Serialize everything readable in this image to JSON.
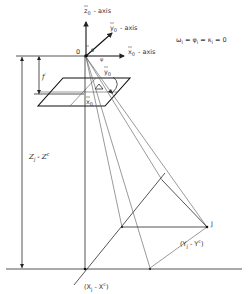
{
  "diagram": {
    "axes": {
      "z_axis_label": "z",
      "z_axis_sub": "0",
      "z_axis_suffix": "- axis",
      "y_axis_label": "y",
      "y_axis_sub": "0",
      "y_axis_suffix": "- axis",
      "x_axis_label": "x",
      "x_axis_sub": "0",
      "x_axis_suffix": "- axis"
    },
    "origin_label": "0",
    "equation": "ω",
    "equation_parts": [
      {
        "sym": "ω",
        "sub": "i"
      },
      {
        "sym": "φ",
        "sub": "i"
      },
      {
        "sym": "κ",
        "sub": "i"
      }
    ],
    "equation_value": "0",
    "focal_label": "f",
    "image_y_label": "y",
    "image_y_sub": "0",
    "image_x_label": "x",
    "image_x_sub": "0",
    "height_label": "Z",
    "height_label_sub": "j",
    "height_label_rest": "- Z",
    "height_label_sup": "c",
    "point_label": "J",
    "y_diff_label": "(Y",
    "y_diff_sub": "j",
    "y_diff_rest": "- Y",
    "y_diff_sup": "c",
    "y_diff_close": ")",
    "x_diff_label": "(X",
    "x_diff_sub": "j",
    "x_diff_rest": "- X",
    "x_diff_sup": "c",
    "x_diff_close": ")",
    "angle_symbols": [
      "θ",
      "ψ"
    ]
  }
}
